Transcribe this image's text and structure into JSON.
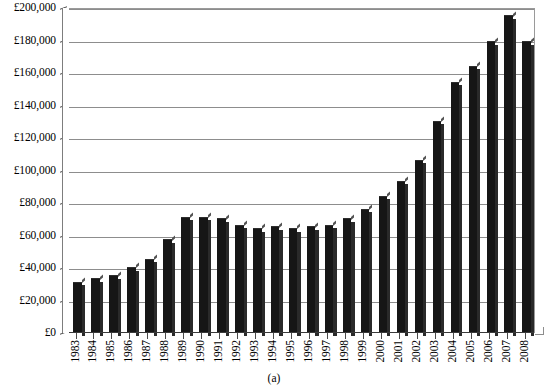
{
  "chart_data": {
    "type": "bar",
    "title": "",
    "subtitle": "",
    "caption": "(a)",
    "xlabel": "",
    "ylabel": "",
    "ylim": [
      0,
      200000
    ],
    "ytick_step": 20000,
    "ytick_labels": [
      "£200,000",
      "£180,000",
      "£160,000",
      "£140,000",
      "£120,000",
      "£100,000",
      "£80,000",
      "£60,000",
      "£40,000",
      "£20,000",
      "£0"
    ],
    "ytick_values": [
      200000,
      180000,
      160000,
      140000,
      120000,
      100000,
      80000,
      60000,
      40000,
      20000,
      0
    ],
    "grid": true,
    "legend": null,
    "currency": "GBP",
    "bar_color": "#161616",
    "categories": [
      "1983",
      "1984",
      "1985",
      "1986",
      "1987",
      "1988",
      "1989",
      "1990",
      "1991",
      "1992",
      "1993",
      "1994",
      "1995",
      "1996",
      "1997",
      "1998",
      "1999",
      "2000",
      "2001",
      "2002",
      "2003",
      "2004",
      "2005",
      "2006",
      "2007",
      "2008"
    ],
    "values": [
      31000,
      33000,
      35000,
      40000,
      45000,
      57000,
      71000,
      71000,
      70000,
      66000,
      64000,
      65000,
      64000,
      65000,
      66000,
      70000,
      76000,
      84000,
      93000,
      106000,
      130000,
      154000,
      164000,
      179000,
      195000,
      179000
    ]
  }
}
